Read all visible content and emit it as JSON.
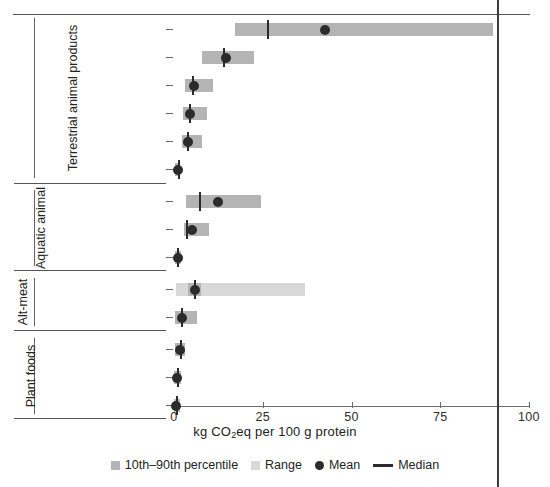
{
  "chart_data": {
    "type": "bar",
    "title": "",
    "xlabel": "kg CO2eq per 100 g protein",
    "xlabel_parts": {
      "pre": "kg CO",
      "sub": "2",
      "post": "eq per 100 g protein"
    },
    "ylabel": "",
    "xlim": [
      0,
      100
    ],
    "xticks": [
      0,
      25,
      50,
      75,
      100
    ],
    "xticklabels": [
      "0",
      "25",
      "50",
      "75",
      "100"
    ],
    "grid": false,
    "legend_position": "bottom",
    "legend": [
      {
        "key": "iqr",
        "label": "10th–90th percentile",
        "marker": "square",
        "color": "#b4b4b4"
      },
      {
        "key": "range",
        "label": "Range",
        "marker": "square",
        "color": "#d8d8d8"
      },
      {
        "key": "mean",
        "label": "Mean",
        "marker": "circle",
        "color": "#2b2b2b"
      },
      {
        "key": "median",
        "label": "Median",
        "marker": "line",
        "color": "#2b2b2b"
      }
    ],
    "groups": [
      {
        "label": "Terrestrial animal products",
        "categories": [
          {
            "label": "Beef, beef herd (106)",
            "n": 106,
            "range": [
              17.2,
              89.9
            ],
            "iqr": [
              17.2,
              89.9
            ],
            "median": 26.2,
            "mean": 42.5
          },
          {
            "label": "Beef, dairy herd (43)",
            "n": 43,
            "range": [
              7.8,
              22.5
            ],
            "iqr": [
              7.8,
              22.5
            ],
            "median": 13.9,
            "mean": 14.6
          },
          {
            "label": "Pig meat (75)",
            "n": 75,
            "range": [
              3.1,
              11.0
            ],
            "iqr": [
              3.1,
              11.0
            ],
            "median": 5.2,
            "mean": 5.7
          },
          {
            "label": "Poultry meat (46)",
            "n": 46,
            "range": [
              2.5,
              9.3
            ],
            "iqr": [
              2.5,
              9.3
            ],
            "median": 4.1,
            "mean": 4.6
          },
          {
            "label": "Eggs (31)",
            "n": 31,
            "range": [
              2.2,
              7.9
            ],
            "iqr": [
              2.2,
              7.9
            ],
            "median": 3.6,
            "mean": 4.0
          },
          {
            "label": "Insects (2)",
            "n": 2,
            "range": [
              0.3,
              1.8
            ],
            "iqr": [
              0.3,
              1.8
            ],
            "median": 1.0,
            "mean": 1.1
          }
        ]
      },
      {
        "label": "Aquatic animal",
        "categories": [
          {
            "label": "Farmed crustaceans (21)",
            "n": 21,
            "range": [
              3.4,
              24.5
            ],
            "iqr": [
              3.4,
              24.5
            ],
            "median": 7.0,
            "mean": 12.4
          },
          {
            "label": "Farmed fish (54)",
            "n": 54,
            "range": [
              2.8,
              9.9
            ],
            "iqr": [
              2.8,
              9.9
            ],
            "median": 3.4,
            "mean": 5.1
          },
          {
            "label": "Wild tuna (2)",
            "n": 2,
            "range": [
              0.2,
              1.9
            ],
            "iqr": [
              0.2,
              1.9
            ],
            "median": 0.9,
            "mean": 1.0
          }
        ]
      },
      {
        "label": "Alt-meat",
        "categories": [
          {
            "label": "Cell-based (4)",
            "n": 4,
            "range": [
              0.5,
              36.9
            ],
            "iqr": [
              4.0,
              7.5
            ],
            "median": 5.5,
            "mean": 5.9
          },
          {
            "label": "Plant-based (11)",
            "n": 11,
            "range": [
              0.2,
              6.5
            ],
            "iqr": [
              0.2,
              6.5
            ],
            "median": 2.0,
            "mean": 2.2
          }
        ]
      },
      {
        "label": "Plant foods",
        "categories": [
          {
            "label": "Tofu (47)",
            "n": 47,
            "range": [
              0.2,
              3.2
            ],
            "iqr": [
              0.2,
              3.2
            ],
            "median": 1.6,
            "mean": 1.7
          },
          {
            "label": "Pulses, excluding peas (44)",
            "n": 44,
            "range": [
              0.1,
              2.1
            ],
            "iqr": [
              0.1,
              2.1
            ],
            "median": 0.8,
            "mean": 0.9
          },
          {
            "label": "Peas (33)",
            "n": 33,
            "range": [
              0.0,
              1.6
            ],
            "iqr": [
              0.0,
              1.6
            ],
            "median": 0.6,
            "mean": 0.7
          }
        ]
      }
    ]
  }
}
